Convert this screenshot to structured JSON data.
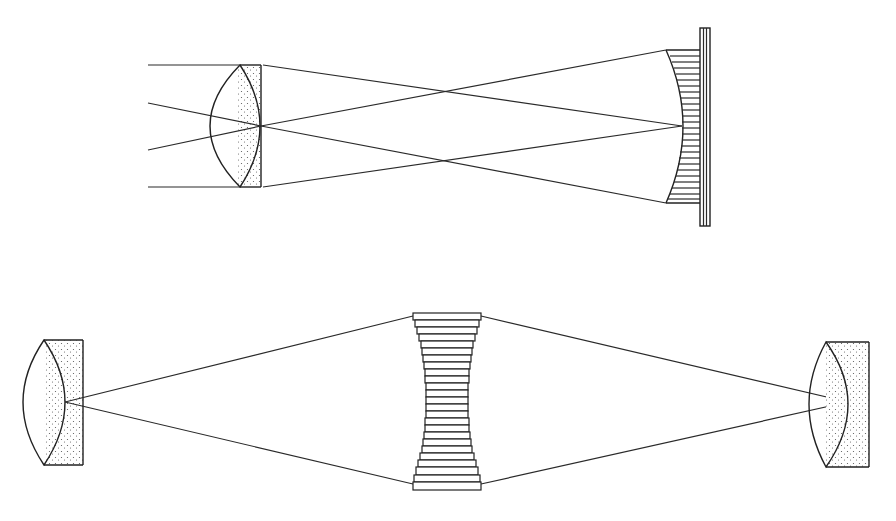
{
  "diagram": {
    "type": "optical schematic",
    "colors": {
      "ink": "#2a2a2a",
      "background": "#ffffff",
      "stipple": "#555555"
    },
    "top": {
      "description": "Lens focusing parallel and oblique rays onto a curved stepped mirror/plate stack",
      "lens": {
        "x": 200,
        "y_top": 65,
        "y_bottom": 187,
        "flat_face_x": 261
      },
      "stepped_mirror": {
        "x_left": 665,
        "x_right": 710,
        "y_top": 28,
        "y_bottom": 226,
        "curve_apex_x": 682
      },
      "incoming_rays": [
        {
          "from": [
            148,
            65
          ],
          "to": [
            240,
            65
          ]
        },
        {
          "from": [
            148,
            103
          ],
          "to": [
            261,
            126
          ]
        },
        {
          "from": [
            148,
            150
          ],
          "to": [
            261,
            126
          ]
        },
        {
          "from": [
            148,
            187
          ],
          "to": [
            240,
            187
          ]
        }
      ],
      "outgoing_rays": [
        {
          "from": [
            263,
            65
          ],
          "to": [
            682,
            126
          ]
        },
        {
          "from": [
            263,
            187
          ],
          "to": [
            682,
            126
          ]
        },
        {
          "from": [
            261,
            126
          ],
          "to": [
            665,
            50
          ]
        },
        {
          "from": [
            261,
            126
          ],
          "to": [
            665,
            203
          ]
        }
      ]
    },
    "bottom": {
      "description": "Two stippled lenses facing each other with a concave stack of plates between them",
      "left_lens": {
        "x_left": 22,
        "x_right": 83,
        "y_top": 340,
        "y_bottom": 465,
        "focus": [
          65,
          402
        ]
      },
      "plate_stack": {
        "x_center": 447,
        "y_top": 313,
        "y_bottom": 490,
        "plate_count": 24
      },
      "right_lens": {
        "x_left": 805,
        "x_right": 869,
        "y_top": 342,
        "y_bottom": 467,
        "focus": [
          848,
          402
        ]
      },
      "rays": [
        {
          "from": [
            65,
            402
          ],
          "to": [
            413,
            316
          ]
        },
        {
          "from": [
            65,
            402
          ],
          "to": [
            413,
            484
          ]
        },
        {
          "from": [
            481,
            316
          ],
          "to": [
            848,
            402
          ]
        },
        {
          "from": [
            481,
            484
          ],
          "to": [
            848,
            402
          ]
        }
      ]
    }
  }
}
